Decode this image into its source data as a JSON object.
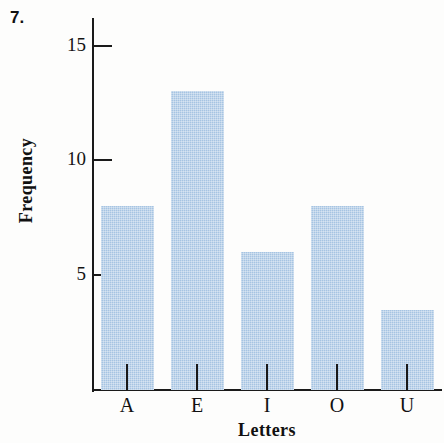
{
  "problem": {
    "number": "7."
  },
  "chart_data": {
    "type": "bar",
    "title": "",
    "subtitle": "",
    "xlabel": "Letters",
    "ylabel": "Frequency",
    "categories": [
      "A",
      "E",
      "I",
      "O",
      "U"
    ],
    "values": [
      8,
      13,
      6,
      8,
      3.5
    ],
    "series": [
      {
        "name": "Frequency",
        "values": [
          8,
          13,
          6,
          8,
          3.5
        ]
      }
    ],
    "ylim": [
      0,
      16.2
    ],
    "xlim": [
      0,
      5
    ],
    "y_ticks": [
      5,
      10,
      15
    ],
    "y_tick_labels": [
      "5",
      "10",
      "15"
    ],
    "x_tick_labels": [
      "A",
      "E",
      "I",
      "O",
      "U"
    ],
    "grid": false,
    "legend": false,
    "legend_position": "none",
    "bar_color": "#a6c4e2",
    "axis_color": "#1a1a1a",
    "text_color": "#111111",
    "background_color": "#fdfdfc",
    "annotations": []
  }
}
